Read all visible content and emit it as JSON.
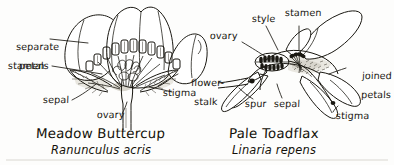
{
  "figure": {
    "background_color": "#fdfdfc",
    "ink_color": "#1a1812"
  },
  "specimens": [
    {
      "id": "meadow-buttercup",
      "common_name": "Meadow Buttercup",
      "latin_name": "Ranunculus acris",
      "labels": [
        {
          "id": "separate-petals",
          "text_line1": "separate",
          "text_line2": "petals"
        },
        {
          "id": "stamen",
          "text_line1": "stamen",
          "text_line2": ""
        },
        {
          "id": "sepal",
          "text_line1": "sepal",
          "text_line2": ""
        },
        {
          "id": "ovary",
          "text_line1": "ovary",
          "text_line2": ""
        },
        {
          "id": "flower-stalk",
          "text_line1": "flower-",
          "text_line2": "stalk"
        },
        {
          "id": "stigma",
          "text_line1": "stigma",
          "text_line2": ""
        }
      ]
    },
    {
      "id": "pale-toadflax",
      "common_name": "Pale Toadflax",
      "latin_name": "Linaria repens",
      "labels": [
        {
          "id": "style",
          "text_line1": "style",
          "text_line2": ""
        },
        {
          "id": "stamen",
          "text_line1": "stamen",
          "text_line2": ""
        },
        {
          "id": "ovary",
          "text_line1": "ovary",
          "text_line2": ""
        },
        {
          "id": "joined-petals",
          "text_line1": "joined",
          "text_line2": "petals"
        },
        {
          "id": "spur",
          "text_line1": "spur",
          "text_line2": ""
        },
        {
          "id": "sepal",
          "text_line1": "sepal",
          "text_line2": ""
        },
        {
          "id": "stigma",
          "text_line1": "stigma",
          "text_line2": ""
        }
      ]
    }
  ]
}
